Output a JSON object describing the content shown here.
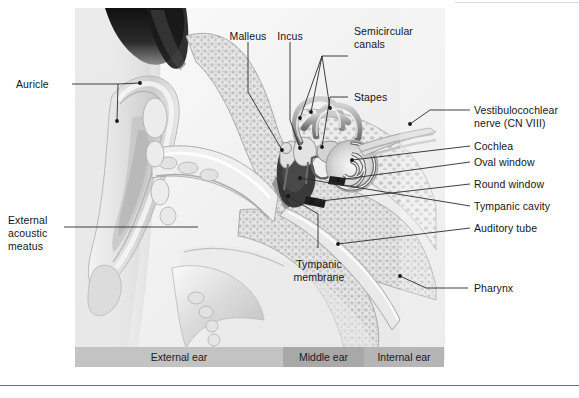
{
  "figure": {
    "background_color": "#ffffff",
    "text_color": "#15151a",
    "leader_color": "#2a2a2e"
  },
  "labels": {
    "auricle": "Auricle",
    "external_acoustic_meatus_line1": "External",
    "external_acoustic_meatus_line2": "acoustic",
    "external_acoustic_meatus_line3": "meatus",
    "malleus": "Malleus",
    "incus": "Incus",
    "semicircular_canals_line1": "Semicircular",
    "semicircular_canals_line2": "canals",
    "stapes": "Stapes",
    "vestibulocochlear_nerve_line1": "Vestibulocochlear",
    "vestibulocochlear_nerve_line2": "nerve (CN VIII)",
    "cochlea": "Cochlea",
    "oval_window": "Oval window",
    "round_window": "Round window",
    "tympanic_cavity": "Tympanic cavity",
    "auditory_tube": "Auditory tube",
    "pharynx": "Pharynx",
    "tympanic_membrane_line1": "Tympanic",
    "tympanic_membrane_line2": "membrane"
  },
  "regions": {
    "external_ear": "External ear",
    "middle_ear": "Middle ear",
    "internal_ear": "Internal ear",
    "external_ear_color": "#c3c3c3",
    "middle_ear_color": "#a8a8a8",
    "internal_ear_color": "#b5b5b5"
  }
}
